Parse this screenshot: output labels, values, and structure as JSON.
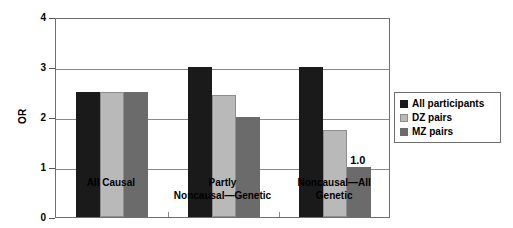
{
  "chart_data": {
    "type": "bar",
    "title": "",
    "subtitle": "",
    "xlabel": "",
    "ylabel": "OR",
    "ylim": [
      0,
      4
    ],
    "ytick_labels": [
      "0",
      "1",
      "2",
      "3",
      "4"
    ],
    "ytick_values": [
      0,
      1,
      2,
      3,
      4
    ],
    "grid": true,
    "grid_axis": "y",
    "legend_position": "right",
    "categories": [
      "All Causal",
      "Partly\nNoncausal—Genetic",
      "Noncausal—All\nGenetic"
    ],
    "series": [
      {
        "name": "All participants",
        "color": "#1a1a1a",
        "values": [
          2.5,
          3.0,
          3.0
        ]
      },
      {
        "name": "DZ pairs",
        "color": "#b9b9b9",
        "values": [
          2.5,
          2.45,
          1.75
        ]
      },
      {
        "name": "MZ pairs",
        "color": "#6b6b6b",
        "values": [
          2.5,
          2.0,
          1.0
        ]
      }
    ],
    "annotations": [
      {
        "text": "1.0",
        "category_index": 2,
        "series_index": 2,
        "value": 1.0
      }
    ]
  },
  "axis": {
    "y_title": "OR"
  },
  "legend": {
    "items": [
      {
        "label": "All participants",
        "swatch": "series-0-swatch"
      },
      {
        "label": "DZ pairs",
        "swatch": "series-1-swatch"
      },
      {
        "label": "MZ pairs",
        "swatch": "series-2-swatch"
      }
    ]
  }
}
